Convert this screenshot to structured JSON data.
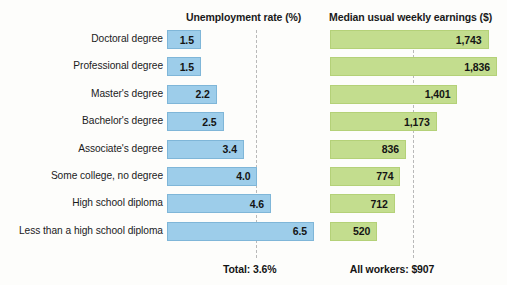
{
  "headers": {
    "unemployment": "Unemployment rate (%)",
    "earnings": "Median usual weekly earnings ($)"
  },
  "footer": {
    "total": "Total: 3.6%",
    "all_workers": "All workers: $907"
  },
  "colors": {
    "bar_blue": "#9dcdea",
    "bar_blue_border": "#7fb6d8",
    "bar_green": "#c3dd8e",
    "bar_green_border": "#b4d178",
    "dash_line": "#b9b9b9",
    "text": "#141414",
    "background": "#fdfdfb"
  },
  "chart_data": {
    "type": "bar",
    "title": "",
    "orientation": "horizontal",
    "categories": [
      "Doctoral degree",
      "Professional degree",
      "Master's degree",
      "Bachelor's degree",
      "Associate's degree",
      "Some college, no degree",
      "High school diploma",
      "Less than a high school diploma"
    ],
    "series": [
      {
        "name": "Unemployment rate (%)",
        "values": [
          1.5,
          1.5,
          2.2,
          2.5,
          3.4,
          4.0,
          4.6,
          6.5
        ],
        "labels": [
          "1.5",
          "1.5",
          "2.2",
          "2.5",
          "3.4",
          "4.0",
          "4.6",
          "6.5"
        ],
        "color": "#9dcdea",
        "xlim": [
          0,
          6.5
        ],
        "reference_line": {
          "value": 3.6,
          "label": "Total: 3.6%"
        }
      },
      {
        "name": "Median usual weekly earnings ($)",
        "values": [
          1743,
          1836,
          1401,
          1173,
          836,
          774,
          712,
          520
        ],
        "labels": [
          "1,743",
          "1,836",
          "1,401",
          "1,173",
          "836",
          "774",
          "712",
          "520"
        ],
        "color": "#c3dd8e",
        "xlim": [
          0,
          1836
        ],
        "reference_line": {
          "value": 907,
          "label": "All workers: $907"
        }
      }
    ],
    "xlabel": "",
    "ylabel": "",
    "grid": false,
    "legend": "none"
  },
  "rows": [
    {
      "label": "Doctoral degree",
      "rate_label": "1.5",
      "rate": 1.5,
      "earn_label": "1,743",
      "earn": 1743
    },
    {
      "label": "Professional degree",
      "rate_label": "1.5",
      "rate": 1.5,
      "earn_label": "1,836",
      "earn": 1836
    },
    {
      "label": "Master's degree",
      "rate_label": "2.2",
      "rate": 2.2,
      "earn_label": "1,401",
      "earn": 1401
    },
    {
      "label": "Bachelor's degree",
      "rate_label": "2.5",
      "rate": 2.5,
      "earn_label": "1,173",
      "earn": 1173
    },
    {
      "label": "Associate's degree",
      "rate_label": "3.4",
      "rate": 3.4,
      "earn_label": "836",
      "earn": 836
    },
    {
      "label": "Some college, no degree",
      "rate_label": "4.0",
      "rate": 4.0,
      "earn_label": "774",
      "earn": 774
    },
    {
      "label": "High school diploma",
      "rate_label": "4.6",
      "rate": 4.6,
      "earn_label": "712",
      "earn": 712
    },
    {
      "label": "Less than a high school diploma",
      "rate_label": "6.5",
      "rate": 6.5,
      "earn_label": "520",
      "earn": 520
    }
  ]
}
